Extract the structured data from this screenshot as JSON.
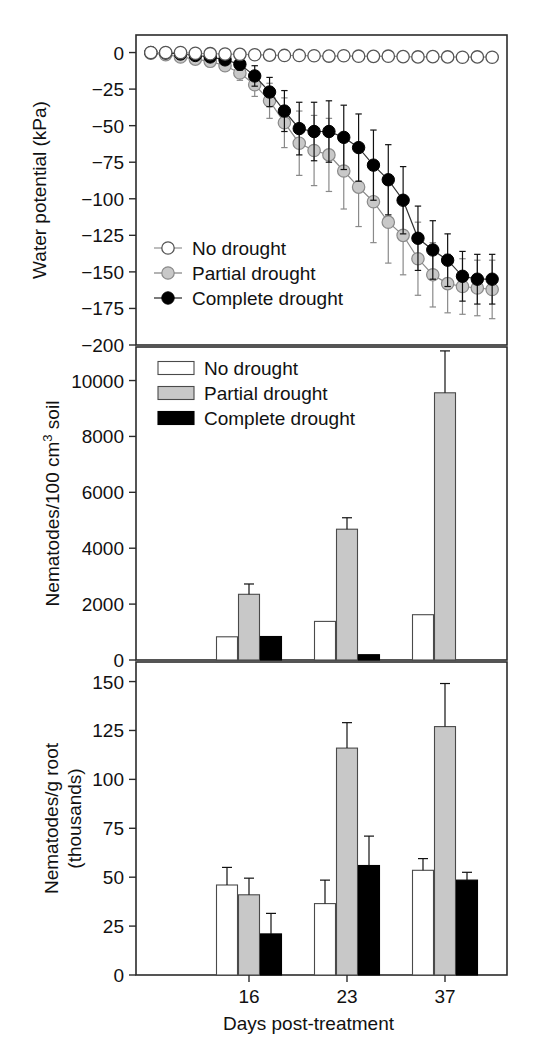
{
  "figure": {
    "title": "",
    "xlabel": "Days post-treatment",
    "colors": {
      "no_drought": "#ffffff",
      "partial_drought": "#c8c8c8",
      "complete_drought": "#000000",
      "axis": "#2b2b2b",
      "gray_line": "#8a8a8a"
    }
  },
  "chart_data": [
    {
      "type": "line",
      "panel": "top",
      "title": "",
      "xlabel": "",
      "ylabel": "Water potential (kPa)",
      "ylim": [
        -200,
        12
      ],
      "yticks": [
        0,
        -25,
        -50,
        -75,
        -100,
        -125,
        -150,
        -175,
        -200
      ],
      "ytick_labels": [
        "0",
        "−25",
        "−50",
        "−75",
        "−100",
        "−125",
        "−150",
        "−175",
        "−200"
      ],
      "xlim": [
        0,
        25
      ],
      "grid": false,
      "legend_position": "lower-left",
      "x": [
        1,
        2,
        3,
        4,
        5,
        6,
        7,
        8,
        9,
        10,
        11,
        12,
        13,
        14,
        15,
        16,
        17,
        18,
        19,
        20,
        21,
        22,
        23,
        24
      ],
      "series": [
        {
          "name": "No drought",
          "marker": "open-circle",
          "values": [
            0,
            0,
            0,
            -0.5,
            -0.8,
            -1,
            -1.2,
            -1.5,
            -1.8,
            -2,
            -2,
            -2.2,
            -2.4,
            -2.2,
            -2.5,
            -2.6,
            -2.5,
            -2.8,
            -3,
            -2.8,
            -3,
            -3.2,
            -3,
            -3.2
          ],
          "errors": [
            0,
            0,
            0,
            0,
            0,
            0,
            0,
            0,
            0,
            0,
            0,
            0,
            0,
            0,
            0,
            0,
            0,
            0,
            0,
            0,
            0,
            0,
            0,
            0
          ]
        },
        {
          "name": "Partial drought",
          "marker": "gray-circle",
          "values": [
            -0.5,
            -1.5,
            -3,
            -4.5,
            -6,
            -9,
            -14,
            -22,
            -33,
            -48,
            -62,
            -67,
            -70,
            -81,
            -92,
            -102,
            -116,
            -125,
            -141,
            -152,
            -158,
            -160,
            -161,
            -162
          ],
          "errors": [
            0,
            0,
            1,
            1.5,
            2,
            3,
            5,
            8,
            12,
            17,
            22,
            24,
            25,
            26,
            27,
            28,
            28,
            27,
            25,
            22,
            20,
            19,
            19,
            20
          ]
        },
        {
          "name": "Complete drought",
          "marker": "filled-circle",
          "values": [
            0,
            -0.3,
            -1,
            -2,
            -3,
            -5,
            -8,
            -16,
            -27,
            -40,
            -52,
            -54,
            -54,
            -58,
            -65,
            -77,
            -87,
            -101,
            -127,
            -135,
            -142,
            -153,
            -155,
            -155
          ],
          "errors": [
            0,
            0,
            0.5,
            1,
            1.5,
            2.5,
            4,
            7,
            10,
            14,
            18,
            20,
            21,
            22,
            23,
            24,
            24,
            23,
            22,
            20,
            18,
            17,
            17,
            17
          ]
        }
      ],
      "legend": [
        {
          "label": "No drought",
          "marker": "open-circle"
        },
        {
          "label": "Partial drought",
          "marker": "gray-circle"
        },
        {
          "label": "Complete drought",
          "marker": "filled-circle"
        }
      ]
    },
    {
      "type": "bar",
      "panel": "middle",
      "title": "",
      "xlabel": "",
      "ylabel": "Nematodes/100 cm³ soil",
      "ylim": [
        0,
        11200
      ],
      "yticks": [
        0,
        2000,
        4000,
        6000,
        8000,
        10000
      ],
      "ytick_labels": [
        "0",
        "2000",
        "4000",
        "6000",
        "8000",
        "10000"
      ],
      "categories": [
        "16",
        "23",
        "37"
      ],
      "grid": false,
      "legend_position": "upper-left",
      "series": [
        {
          "name": "No drought",
          "swatch": "white",
          "values": [
            830,
            1380,
            1620
          ],
          "errors": [
            0,
            0,
            0
          ]
        },
        {
          "name": "Partial drought",
          "swatch": "gray",
          "values": [
            2350,
            4680,
            9560
          ],
          "errors": [
            370,
            410,
            1500
          ]
        },
        {
          "name": "Complete drought",
          "swatch": "black",
          "values": [
            840,
            190,
            null
          ],
          "errors": [
            0,
            0,
            null
          ]
        }
      ],
      "legend": [
        {
          "label": "No drought",
          "swatch": "white"
        },
        {
          "label": "Partial drought",
          "swatch": "gray"
        },
        {
          "label": "Complete drought",
          "swatch": "black"
        }
      ]
    },
    {
      "type": "bar",
      "panel": "bottom",
      "title": "",
      "xlabel": "Days post-treatment",
      "ylabel": "Nematodes/g root (thousands)",
      "ylim": [
        0,
        160
      ],
      "yticks": [
        0,
        25,
        50,
        75,
        100,
        125,
        150
      ],
      "ytick_labels": [
        "0",
        "25",
        "50",
        "75",
        "100",
        "125",
        "150"
      ],
      "categories": [
        "16",
        "23",
        "37"
      ],
      "grid": false,
      "legend_position": "none",
      "series": [
        {
          "name": "No drought",
          "swatch": "white",
          "values": [
            46,
            36.5,
            53.5
          ],
          "errors": [
            9,
            12,
            6
          ]
        },
        {
          "name": "Partial drought",
          "swatch": "gray",
          "values": [
            41,
            116,
            127
          ],
          "errors": [
            8.5,
            13,
            22
          ]
        },
        {
          "name": "Complete drought",
          "swatch": "black",
          "values": [
            21,
            56,
            48.5
          ],
          "errors": [
            10.5,
            15,
            4
          ]
        }
      ],
      "legend": []
    }
  ],
  "panels": {
    "top": {
      "ylabel": "Water potential (kPa)",
      "yticks": [
        "0",
        "−25",
        "−50",
        "−75",
        "−100",
        "−125",
        "−150",
        "−175",
        "−200"
      ],
      "legend": [
        "No drought",
        "Partial drought",
        "Complete drought"
      ]
    },
    "middle": {
      "ylabel_line1": "Nematodes/100 cm",
      "ylabel_sup": "3",
      "ylabel_line2": " soil",
      "yticks": [
        "0",
        "2000",
        "4000",
        "6000",
        "8000",
        "10000"
      ],
      "legend": [
        "No drought",
        "Partial drought",
        "Complete drought"
      ]
    },
    "bottom": {
      "ylabel_line1": "Nematodes/g root",
      "ylabel_line2": "(thousands)",
      "yticks": [
        "0",
        "25",
        "50",
        "75",
        "100",
        "125",
        "150"
      ],
      "xticks": [
        "16",
        "23",
        "37"
      ],
      "xlabel": "Days post-treatment"
    }
  }
}
